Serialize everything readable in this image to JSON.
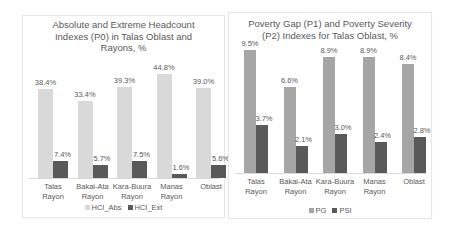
{
  "chart_data": [
    {
      "type": "bar",
      "title": "Absolute and Extreme Headcount Indexes (P0) in Talas Oblast and Rayons, %",
      "title_lines": [
        "Absolute and Extreme Headcount",
        "Indexes (P0) in Talas Oblast and",
        "Rayons, %"
      ],
      "categories": [
        "Talas Rayon",
        "Bakai-Ata Rayon",
        "Kara-Buura Rayon",
        "Manas Rayon",
        "Oblast"
      ],
      "category_lines": [
        [
          "Talas",
          "Rayon"
        ],
        [
          "Bakai-Ata",
          "Rayon"
        ],
        [
          "Kara-Buura",
          "Rayon"
        ],
        [
          "Manas",
          "Rayon"
        ],
        [
          "Oblast"
        ]
      ],
      "series": [
        {
          "name": "HCI_Abs",
          "color": "#d9d9d9",
          "values": [
            38.4,
            33.4,
            39.3,
            44.8,
            39.0
          ],
          "labels": [
            "38.4%",
            "33.4%",
            "39.3%",
            "44.8%",
            "39.0%"
          ]
        },
        {
          "name": "HCI_Ext",
          "color": "#595959",
          "values": [
            7.4,
            5.7,
            7.5,
            1.6,
            5.6
          ],
          "labels": [
            "7.4%",
            "5.7%",
            "7.5%",
            "1.6%",
            "5.6%"
          ]
        }
      ],
      "xlabel": "",
      "ylabel": "",
      "ylim": [
        0,
        50
      ],
      "grid": false,
      "legend_position": "bottom"
    },
    {
      "type": "bar",
      "title": "Poverty Gap (P1) and Poverty Severity (P2) Indexes for Talas Oblast, %",
      "title_lines": [
        "Poverty Gap (P1) and Poverty Severity",
        "(P2) Indexes for Talas Oblast, %"
      ],
      "categories": [
        "Talas Rayon",
        "Bakai-Ata Rayon",
        "Kara-Buura Rayon",
        "Manas Rayon",
        "Oblast"
      ],
      "category_lines": [
        [
          "Talas",
          "Rayon"
        ],
        [
          "Bakai-Ata",
          "Rayon"
        ],
        [
          "Kara-Buura",
          "Rayon"
        ],
        [
          "Manas",
          "Rayon"
        ],
        [
          "Oblast"
        ]
      ],
      "series": [
        {
          "name": "PG",
          "color": "#a6a6a6",
          "values": [
            9.5,
            6.6,
            8.9,
            8.9,
            8.4
          ],
          "labels": [
            "9.5%",
            "6.6%",
            "8.9%",
            "8.9%",
            "8.4%"
          ]
        },
        {
          "name": "PSI",
          "color": "#595959",
          "values": [
            3.7,
            2.1,
            3.0,
            2.4,
            2.8
          ],
          "labels": [
            "3.7%",
            "2.1%",
            "3.0%",
            "2.4%",
            "2.8%"
          ]
        }
      ],
      "xlabel": "",
      "ylabel": "",
      "ylim": [
        0,
        10
      ],
      "grid": false,
      "legend_position": "bottom"
    }
  ]
}
